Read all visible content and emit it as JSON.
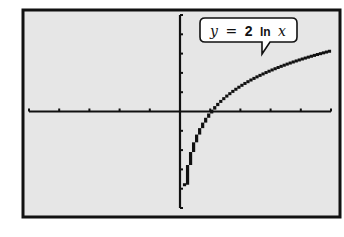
{
  "chart_data": {
    "type": "line",
    "title": "",
    "function": "y = 2 ln x",
    "annotation": {
      "text_var": "y",
      "text_eq": "=",
      "text_coef": "2",
      "text_fn": "ln",
      "text_arg": "x"
    },
    "xlabel": "",
    "ylabel": "",
    "xlim": [
      -5,
      5
    ],
    "ylim": [
      -5,
      5
    ],
    "x_tick_step": 1,
    "y_tick_step": 1,
    "grid": false,
    "legend": null,
    "series": [
      {
        "name": "y = 2 ln x",
        "x": [
          0.05,
          0.1,
          0.2,
          0.3,
          0.5,
          0.75,
          1,
          1.5,
          2,
          2.5,
          3,
          3.5,
          4,
          4.5,
          5
        ],
        "values": [
          -5.99,
          -4.61,
          -3.22,
          -2.41,
          -1.39,
          -0.58,
          0,
          0.81,
          1.39,
          1.83,
          2.2,
          2.51,
          2.77,
          3.01,
          3.22
        ]
      }
    ]
  },
  "colors": {
    "screen_bg": "#e6e6e6",
    "ink": "#111111",
    "page_bg": "#ffffff"
  }
}
